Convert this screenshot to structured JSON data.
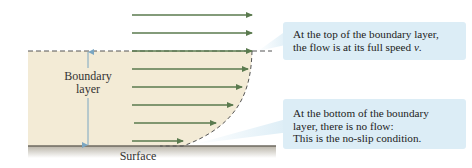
{
  "diagram": {
    "labels": {
      "boundary_layer_line1": "Boundary",
      "boundary_layer_line2": "layer",
      "surface": "Surface"
    },
    "callouts": {
      "top": {
        "line1": "At the top of the boundary layer,",
        "line2_prefix": "the flow is at its full speed ",
        "line2_var": "v",
        "line2_suffix": "."
      },
      "bottom": {
        "line1": "At the bottom of the boundary",
        "line2": "layer, there is no flow:",
        "line3": "This is the no-slip condition."
      }
    },
    "colors": {
      "arrow": "#5a7a4e",
      "boundary_fill": "#f3ebd6",
      "surface": "#8a8478",
      "callout_bg": "#dcedf6",
      "dimension_arrow": "#7aa6c2",
      "dashed_line": "#555555"
    },
    "arrows": [
      {
        "y": 15,
        "x_end": 252
      },
      {
        "y": 33,
        "x_end": 252
      },
      {
        "y": 51,
        "x_end": 252
      },
      {
        "y": 69,
        "x_end": 248
      },
      {
        "y": 87,
        "x_end": 242
      },
      {
        "y": 105,
        "x_end": 233
      },
      {
        "y": 123,
        "x_end": 216
      },
      {
        "y": 141,
        "x_end": 183
      }
    ]
  }
}
